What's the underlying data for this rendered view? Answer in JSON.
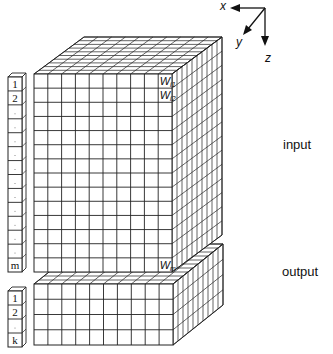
{
  "axes": {
    "x_label": "x",
    "y_label": "y",
    "z_label": "z"
  },
  "labels": {
    "input": "input",
    "output": "output"
  },
  "input_block": {
    "columns": 10,
    "rows": 14,
    "depth": 10,
    "front": {
      "x": 34,
      "y": 74,
      "w": 138,
      "h": 198
    },
    "depth_offset": {
      "dx": 50,
      "dy": -37
    },
    "weight_labels": [
      {
        "base": "W",
        "sub": "i1",
        "row": 0
      },
      {
        "base": "W",
        "sub": "i2",
        "row": 1
      },
      {
        "base": "W",
        "sub": "m",
        "row": 13
      }
    ]
  },
  "output_block": {
    "columns": 10,
    "rows": 4,
    "depth": 10,
    "front": {
      "x": 34,
      "y": 284,
      "w": 139,
      "h": 61
    },
    "depth_offset": {
      "dx": 50,
      "dy": -40
    }
  },
  "input_vector": {
    "cells": 14,
    "front": {
      "x": 8,
      "y": 77,
      "w": 14,
      "h": 195
    },
    "depth_offset": {
      "dx": 4,
      "dy": -4
    },
    "labels": [
      "1",
      "2",
      "",
      "",
      "",
      "",
      "",
      "",
      "",
      "",
      "",
      "",
      "",
      "m"
    ]
  },
  "output_vector": {
    "cells": 4,
    "front": {
      "x": 8,
      "y": 291,
      "w": 14,
      "h": 56
    },
    "depth_offset": {
      "dx": 4,
      "dy": -4
    },
    "labels": [
      "1",
      "2",
      "",
      "k"
    ]
  },
  "colors": {
    "line": "#222222",
    "face": "#ffffff"
  }
}
